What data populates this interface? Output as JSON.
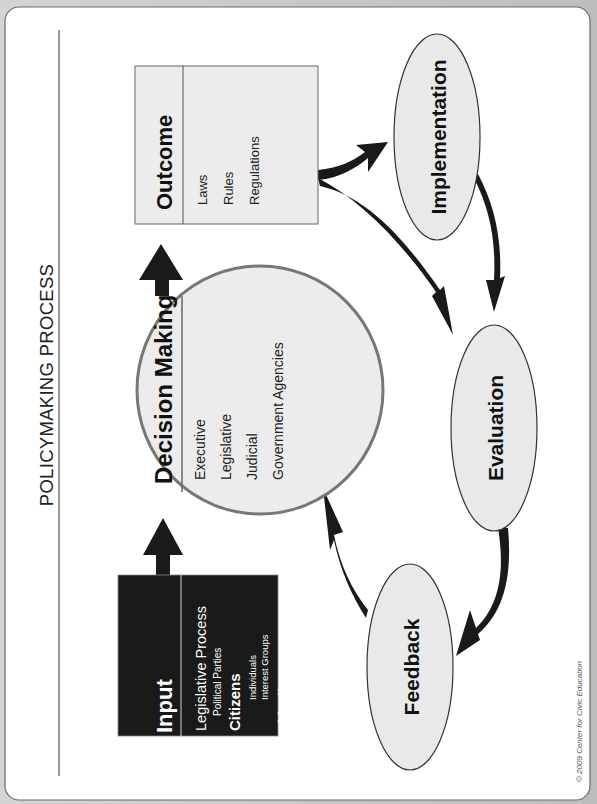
{
  "title": "POLICYMAKING PROCESS",
  "copyright": "© 2009 Center for Civic Education",
  "colors": {
    "page_bg": "#ffffff",
    "outer_bg": "#c9c9c9",
    "input_box": "#1a1a1a",
    "shape_fill": "#e9e9e9",
    "circle_stroke": "#7a7a7a",
    "arrow": "#1a1a1a"
  },
  "input": {
    "heading": "Input",
    "items": [
      {
        "label": "Legislative Process",
        "level": 1
      },
      {
        "label": "Political Parties",
        "level": 2
      },
      {
        "label": "Citizens",
        "level": 1
      },
      {
        "label": "Individuals",
        "level": 2
      },
      {
        "label": "Interest Groups",
        "level": 2
      },
      {
        "label": "Media",
        "level": 1
      }
    ]
  },
  "decision_making": {
    "heading": "Decision Making",
    "items": [
      "Executive",
      "Legislative",
      "Judicial",
      "Government Agencies"
    ]
  },
  "outcome": {
    "heading": "Outcome",
    "items": [
      "Laws",
      "Rules",
      "Regulations"
    ]
  },
  "stages": {
    "implementation": "Implementation",
    "evaluation": "Evaluation",
    "feedback": "Feedback"
  }
}
